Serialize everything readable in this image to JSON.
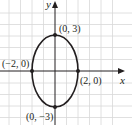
{
  "diagram": {
    "type": "ellipse-graph",
    "axes": {
      "x_label": "x",
      "y_label": "y"
    },
    "colors": {
      "grid": "#d8d8d8",
      "axis": "#231f20",
      "curve": "#231f20",
      "background": "#ffffff"
    },
    "ellipse": {
      "center": [
        0,
        0
      ],
      "a": 2,
      "b": 3
    },
    "points": [
      {
        "label": "(0, 3)",
        "x": 0,
        "y": 3
      },
      {
        "label": "(−2, 0)",
        "x": -2,
        "y": 0
      },
      {
        "label": "(2, 0)",
        "x": 2,
        "y": 0
      },
      {
        "label": "(0, −3)",
        "x": 0,
        "y": -3
      }
    ]
  }
}
